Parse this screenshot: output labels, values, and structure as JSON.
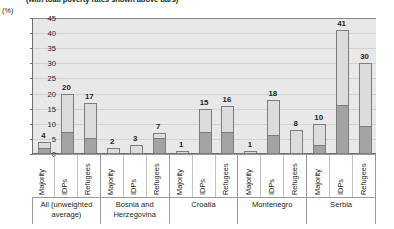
{
  "caption": "(with total poverty rates shown above bars)",
  "axis_unit": "(%)",
  "chart_data": {
    "type": "bar",
    "title": "(with total poverty rates shown above bars)",
    "xlabel": "",
    "ylabel": "(%)",
    "ylim": [
      0,
      45
    ],
    "yticks": [
      0,
      5,
      10,
      15,
      20,
      25,
      30,
      35,
      40,
      45
    ],
    "grid": true,
    "legend": "none",
    "stacked": true,
    "segment_names": [
      "extreme poverty (lower, dark)",
      "additional poverty (upper, light)"
    ],
    "group_label": [
      "All (unweighted average)",
      "Bosnia and Herzegovina",
      "Croatia",
      "Montenegro",
      "Serbia"
    ],
    "categories": [
      "Majority",
      "IDPs",
      "Refugees"
    ],
    "bars": [
      {
        "group": "All (unweighted average)",
        "category": "Majority",
        "total": 4,
        "lower": 1.5
      },
      {
        "group": "All (unweighted average)",
        "category": "IDPs",
        "total": 20,
        "lower": 7
      },
      {
        "group": "All (unweighted average)",
        "category": "Refugees",
        "total": 17,
        "lower": 5
      },
      {
        "group": "Bosnia and Herzegovina",
        "category": "Majority",
        "total": 2,
        "lower": 0
      },
      {
        "group": "Bosnia and Herzegovina",
        "category": "IDPs",
        "total": 3,
        "lower": 0
      },
      {
        "group": "Bosnia and Herzegovina",
        "category": "Refugees",
        "total": 7,
        "lower": 5
      },
      {
        "group": "Croatia",
        "category": "Majority",
        "total": 1,
        "lower": 0
      },
      {
        "group": "Croatia",
        "category": "IDPs",
        "total": 15,
        "lower": 7
      },
      {
        "group": "Croatia",
        "category": "Refugees",
        "total": 16,
        "lower": 7
      },
      {
        "group": "Montenegro",
        "category": "Majority",
        "total": 1,
        "lower": 0
      },
      {
        "group": "Montenegro",
        "category": "IDPs",
        "total": 18,
        "lower": 6
      },
      {
        "group": "Montenegro",
        "category": "Refugees",
        "total": 8,
        "lower": 0
      },
      {
        "group": "Serbia",
        "category": "Majority",
        "total": 10,
        "lower": 2.5
      },
      {
        "group": "Serbia",
        "category": "IDPs",
        "total": 41,
        "lower": 16
      },
      {
        "group": "Serbia",
        "category": "Refugees",
        "total": 30,
        "lower": 9
      }
    ],
    "value_labels": [
      "4",
      "20",
      "17",
      "2",
      "3",
      "7",
      "1",
      "15",
      "16",
      "1",
      "18",
      "8",
      "10",
      "41",
      "30"
    ]
  },
  "colors": {
    "plot_background": "#e8e8e8",
    "bar_upper": "#dcdcdc",
    "bar_lower": "#a3a3a3",
    "bar_outline": "#7d7d7d",
    "axis": "#6e6e6e",
    "gridline": "#d2d2d2",
    "text": "#231f20"
  }
}
